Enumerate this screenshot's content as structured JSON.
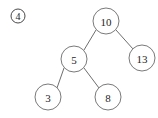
{
  "figure": {
    "marker": {
      "label": "4",
      "style": "circled-number",
      "glyph": "④",
      "cx": 18,
      "cy": 16,
      "r": 7
    },
    "background_color": "#ffffff",
    "node_stroke_color": "#7a7a7a",
    "edge_stroke_color": "#6e6e6e",
    "text_color": "#1d1d1d"
  },
  "chart_data": {
    "type": "diagram",
    "diagram_type": "binary-tree",
    "title": "",
    "nodes": [
      {
        "id": "n10",
        "label": "10",
        "cx": 106,
        "cy": 21,
        "r": 13
      },
      {
        "id": "n13",
        "label": "13",
        "cx": 142,
        "cy": 58,
        "r": 13
      },
      {
        "id": "n5",
        "label": "5",
        "cx": 74,
        "cy": 59,
        "r": 13
      },
      {
        "id": "n3",
        "label": "3",
        "cx": 48,
        "cy": 97,
        "r": 13
      },
      {
        "id": "n8",
        "label": "8",
        "cx": 108,
        "cy": 97,
        "r": 13
      }
    ],
    "edges": [
      {
        "from": "n10",
        "to": "n5",
        "x1": 96,
        "y1": 30,
        "x2": 84,
        "y2": 50
      },
      {
        "from": "n10",
        "to": "n13",
        "x1": 116,
        "y1": 30,
        "x2": 133,
        "y2": 49
      },
      {
        "from": "n5",
        "to": "n3",
        "x1": 64,
        "y1": 68,
        "x2": 57,
        "y2": 88
      },
      {
        "from": "n5",
        "to": "n8",
        "x1": 84,
        "y1": 68,
        "x2": 99,
        "y2": 88
      }
    ]
  }
}
